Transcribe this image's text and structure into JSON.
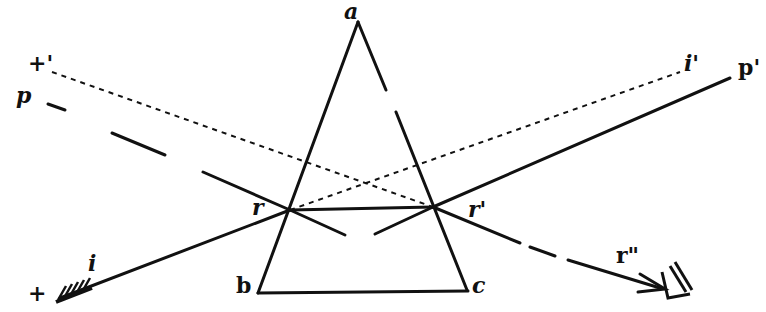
{
  "figure": {
    "labels": {
      "apex": "a",
      "base_left": "b",
      "base_right": "c",
      "incident": "i",
      "incident_ext": "i'",
      "plus_prime": "+'",
      "p": "p",
      "p_prime": "p'",
      "r_entry": "r",
      "r_exit": "r'",
      "r_double": "r\"",
      "plus": "+"
    },
    "colors": {
      "ink": "#111111",
      "paper": "#ffffff"
    }
  }
}
